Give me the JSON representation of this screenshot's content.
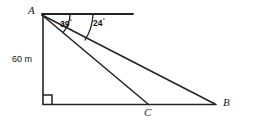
{
  "figure": {
    "kind": "geometry-diagram",
    "background_color": "#ffffff",
    "stroke_color": "#222222",
    "text_color": "#111111"
  },
  "vertices": {
    "A": {
      "label": "A",
      "x": 42,
      "y": 15,
      "label_x": 28,
      "label_y": 6
    },
    "B": {
      "label": "B",
      "x": 215,
      "y": 105,
      "label_x": 222,
      "label_y": 98
    },
    "C": {
      "label": "C",
      "x": 148,
      "y": 104,
      "label_x": 144,
      "label_y": 108
    },
    "D": {
      "label": "",
      "x": 43,
      "y": 104,
      "label_x": 0,
      "label_y": 0
    }
  },
  "segments": [
    {
      "name": "vertical-side-AD",
      "from": "A",
      "to": "D"
    },
    {
      "name": "base-line-DB",
      "from": "D",
      "to": "B"
    },
    {
      "name": "line-of-sight-AC",
      "from": "A",
      "to": "C"
    },
    {
      "name": "line-of-sight-AB",
      "from": "A",
      "to": "B"
    }
  ],
  "horizontal_ray": {
    "name": "horizontal-reference-ray",
    "from_x": 42,
    "from_y": 14,
    "to_x": 133,
    "to_y": 14
  },
  "angles": [
    {
      "name": "angle-39",
      "value": "39",
      "degree_symbol": "°",
      "label_x": 61,
      "label_y": 20,
      "arc_radius": 28,
      "between": "horizontal ray and line AC"
    },
    {
      "name": "angle-24",
      "value": "24",
      "degree_symbol": "°",
      "label_x": 93,
      "label_y": 19,
      "arc_radius": 51,
      "between": "horizontal ray and line AB"
    }
  ],
  "measurements": [
    {
      "name": "height-label",
      "text": "60 m",
      "label_x": 13,
      "label_y": 56,
      "applies_to": "vertical-side-AD"
    }
  ],
  "right_angle": {
    "name": "right-angle-marker",
    "at_vertex": "D",
    "size": 9
  }
}
